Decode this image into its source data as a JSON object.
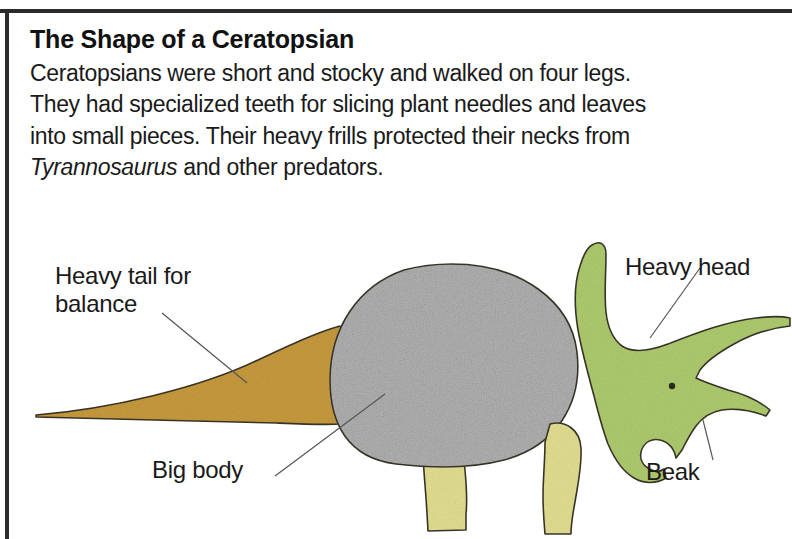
{
  "page": {
    "title": "The Shape of a Ceratopsian",
    "body_text_before": "Ceratopsians were short and stocky and walked on four legs. They had specialized teeth for slicing plant needles and leaves into small pieces. Their heavy frills protected their necks from ",
    "body_text_italic": "Tyrannosaurus",
    "body_text_after": " and other predators."
  },
  "diagram": {
    "labels": {
      "tail": "Heavy tail for\nbalance",
      "body": "Big body",
      "head": "Heavy head",
      "beak": "Beak"
    },
    "parts": {
      "tail_name": "heavy-tail",
      "body_name": "big-body",
      "head_name": "heavy-head",
      "beak_name": "beak",
      "front_leg_name": "front-leg",
      "hind_leg_name": "hind-leg",
      "eye_name": "eye"
    },
    "colors": {
      "tail": "#c79a3c",
      "body": "#b3b3b3",
      "head": "#aecb6e",
      "legs": "#e2de90",
      "outline": "#3a3528",
      "leader_line": "#555555",
      "frame": "#2b2b2b",
      "text": "#1a1a1a"
    }
  }
}
